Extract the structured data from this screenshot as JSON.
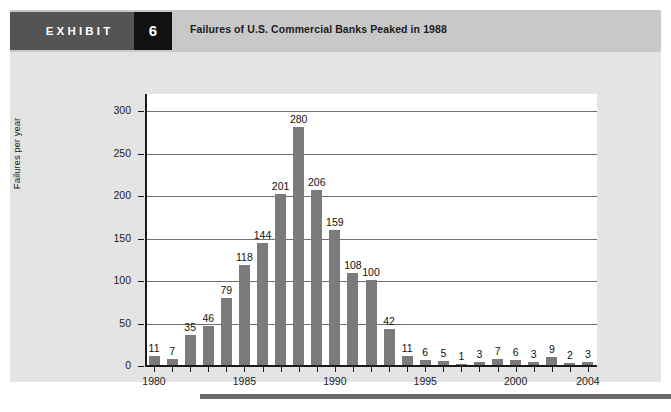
{
  "exhibit": {
    "tab_label": "EXHIBIT",
    "number": "6",
    "title": "Failures of U.S. Commercial Banks Peaked in 1988"
  },
  "colors": {
    "tab_background": "#545454",
    "number_background": "#111111",
    "header_band": "#c8c8c8",
    "panel_background": "#e4e4e4",
    "plot_background": "#ffffff",
    "bar_fill": "#7b7b7b",
    "gridline": "#6f6f6f",
    "axis": "#1a1a1a",
    "footer_rule": "#6a6a6a"
  },
  "chart_data": {
    "type": "bar",
    "title": "Failures of U.S. Commercial Banks Peaked in 1988",
    "xlabel": "",
    "ylabel": "Failures per year",
    "ylim": [
      0,
      320
    ],
    "yticks": [
      0,
      50,
      100,
      150,
      200,
      250,
      300
    ],
    "ytick_labels": [
      "0",
      "50",
      "100",
      "150",
      "200",
      "250",
      "300"
    ],
    "xtick_labels": [
      "1980",
      "1985",
      "1990",
      "1995",
      "2000",
      "2004"
    ],
    "grid": true,
    "legend": null,
    "categories": [
      "1980",
      "1981",
      "1982",
      "1983",
      "1984",
      "1985",
      "1986",
      "1987",
      "1988",
      "1989",
      "1990",
      "1991",
      "1992",
      "1993",
      "1994",
      "1995",
      "1996",
      "1997",
      "1998",
      "1999",
      "2000",
      "2001",
      "2002",
      "2003",
      "2004"
    ],
    "values": [
      11,
      7,
      35,
      46,
      79,
      118,
      144,
      201,
      280,
      206,
      159,
      108,
      100,
      42,
      11,
      6,
      5,
      1,
      3,
      7,
      6,
      3,
      9,
      2,
      3
    ],
    "data_labels": [
      "11",
      "7",
      "35",
      "46",
      "79",
      "118",
      "144",
      "201",
      "280",
      "206",
      "159",
      "108",
      "100",
      "42",
      "11",
      "6",
      "5",
      "1",
      "3",
      "7",
      "6",
      "3",
      "9",
      "2",
      "3"
    ]
  }
}
